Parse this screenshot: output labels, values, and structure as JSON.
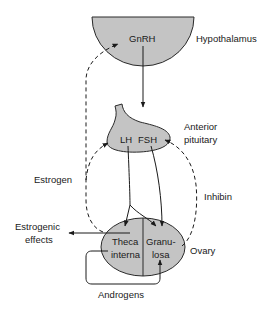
{
  "colors": {
    "organ_fill": "#c4c4c4",
    "stroke": "#2a2a2a",
    "background": "#ffffff"
  },
  "nodes": {
    "hypothalamus": {
      "label": "Hypothalamus",
      "hormone": "GnRH"
    },
    "pituitary": {
      "label_line1": "Anterior",
      "label_line2": "pituitary",
      "hormone_lh": "LH",
      "hormone_fsh": "FSH"
    },
    "ovary": {
      "label": "Ovary",
      "theca_line1": "Theca",
      "theca_line2": "interna",
      "granulosa_line1": "Granu-",
      "granulosa_line2": "losa"
    }
  },
  "edges": {
    "estrogen": "Estrogen",
    "inhibin": "Inhibin",
    "estrogenic_effects_line1": "Estrogenic",
    "estrogenic_effects_line2": "effects",
    "androgens": "Androgens"
  }
}
